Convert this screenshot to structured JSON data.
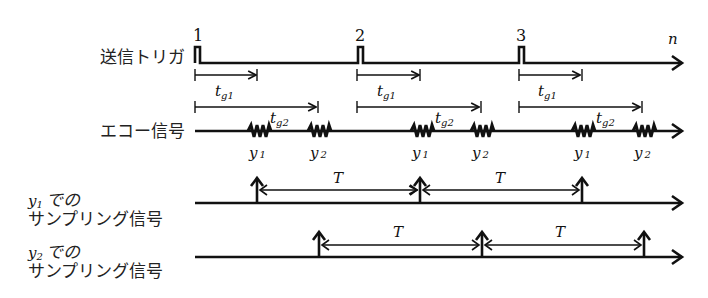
{
  "diagram": {
    "type": "timing-diagram",
    "rows": [
      {
        "id": "trigger",
        "label": "送信トリガ",
        "axis_label": "n"
      },
      {
        "id": "echo",
        "label": "エコー信号"
      },
      {
        "id": "sampling_y1",
        "label_line1_var": "y",
        "label_line1_sub": "1",
        "label_line1_suffix": "での",
        "label_line2": "サンプリング信号"
      },
      {
        "id": "sampling_y2",
        "label_line1_var": "y",
        "label_line1_sub": "2",
        "label_line1_suffix": "での",
        "label_line2": "サンプリング信号"
      }
    ],
    "pulses": [
      {
        "number": "1",
        "x": 194
      },
      {
        "number": "2",
        "x": 357
      },
      {
        "number": "3",
        "x": 518
      }
    ],
    "delays": [
      {
        "var": "t",
        "sub": "g1",
        "length": 63
      },
      {
        "var": "t",
        "sub": "g2",
        "length": 123
      }
    ],
    "echo_labels": [
      {
        "var": "y",
        "sub": "1"
      },
      {
        "var": "y",
        "sub": "2"
      }
    ],
    "period_label": "T",
    "colors": {
      "ink": "#111111",
      "background": "#ffffff"
    }
  }
}
